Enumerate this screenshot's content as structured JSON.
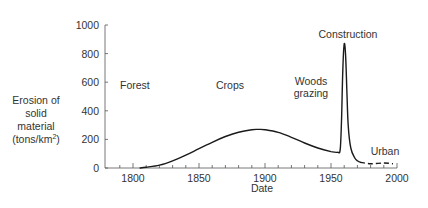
{
  "chart_data": {
    "type": "line",
    "title": "",
    "xlabel": "Date",
    "ylabel_lines": [
      "Erosion of",
      "solid",
      "material",
      "(tons/km",
      "2",
      ")"
    ],
    "ylabel": "Erosion of solid material (tons/km²)",
    "xlim": [
      1780,
      2000
    ],
    "ylim": [
      0,
      1000
    ],
    "x_ticks": [
      1800,
      1850,
      1900,
      1950,
      2000
    ],
    "y_ticks": [
      0,
      200,
      400,
      600,
      800,
      1000
    ],
    "grid": false,
    "series": [
      {
        "name": "Erosion",
        "style": "solid",
        "x": [
          1805,
          1810,
          1820,
          1830,
          1840,
          1850,
          1860,
          1870,
          1880,
          1890,
          1895,
          1900,
          1910,
          1920,
          1930,
          1940,
          1950,
          1955,
          1957,
          1958,
          1959,
          1960,
          1961,
          1962,
          1963,
          1965,
          1968,
          1970,
          1972
        ],
        "values": [
          0,
          5,
          20,
          50,
          90,
          135,
          180,
          220,
          250,
          268,
          270,
          268,
          250,
          215,
          175,
          140,
          115,
          110,
          130,
          350,
          700,
          867,
          800,
          550,
          300,
          140,
          70,
          50,
          40
        ]
      },
      {
        "name": "Urban",
        "style": "dashed",
        "x": [
          1972,
          1980,
          1990,
          1997
        ],
        "values": [
          40,
          30,
          35,
          30
        ]
      }
    ],
    "annotations": [
      {
        "text": "Forest",
        "x": 1810,
        "y": 600
      },
      {
        "text": "Crops",
        "x": 1900,
        "y": 600
      },
      {
        "text": "Woods",
        "x": 1940,
        "y": 620
      },
      {
        "text": "grazing",
        "x": 1940,
        "y": 520
      },
      {
        "text": "Construction",
        "x": 1965,
        "y": 930
      },
      {
        "text": "Urban",
        "x": 1990,
        "y": 70
      }
    ]
  },
  "labels": {
    "forest": "Forest",
    "crops": "Crops",
    "woods": "Woods",
    "grazing": "grazing",
    "construction": "Construction",
    "urban": "Urban",
    "xlabel": "Date",
    "y1": "Erosion of",
    "y2": "solid",
    "y3": "material",
    "y4": "(tons/km",
    "y4sup": "2",
    "y4end": ")"
  }
}
